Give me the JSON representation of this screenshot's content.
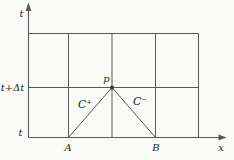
{
  "colors": {
    "background": "#fafaf8",
    "line": "#585858",
    "text": "#262626"
  },
  "labels": {
    "t_axis": "t",
    "x_axis": "x",
    "level_t_plus_dt": "t+Δt",
    "level_t": "t",
    "point_p": "p",
    "point_a": "A",
    "point_b": "B",
    "characteristic_plus": "C⁺",
    "characteristic_minus": "C⁻"
  }
}
